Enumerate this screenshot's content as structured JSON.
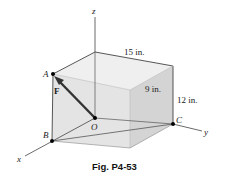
{
  "figure": {
    "caption": "Fig. P4-53",
    "axes": {
      "x": "x",
      "y": "y",
      "z": "z"
    },
    "points": {
      "A": "A",
      "B": "B",
      "C": "C",
      "O": "O"
    },
    "force_label": "F",
    "dimensions": {
      "length": "15 in.",
      "depth": "9 in.",
      "height": "12 in."
    },
    "colors": {
      "box_face": "#e6e6e6",
      "box_side": "#d6d6d6",
      "box_top": "#eeeeee",
      "edge": "#444444",
      "force": "#333333"
    }
  }
}
